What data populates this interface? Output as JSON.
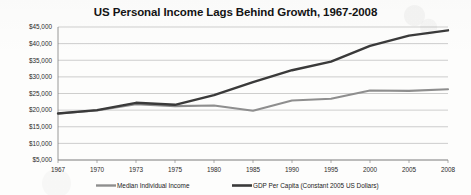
{
  "chart_data": {
    "type": "line",
    "title": "US Personal Income Lags Behind Growth, 1967-2008",
    "xlabel": "",
    "ylabel": "",
    "ylim": [
      5000,
      45000
    ],
    "ytick_values": [
      5000,
      10000,
      15000,
      20000,
      25000,
      30000,
      35000,
      40000,
      45000
    ],
    "ytick_labels": [
      "$5,000",
      "$10,000",
      "$15,000",
      "$20,000",
      "$25,000",
      "$30,000",
      "$35,000",
      "$40,000",
      "$45,000"
    ],
    "categories": [
      "1967",
      "1970",
      "1973",
      "1975",
      "1980",
      "1985",
      "1990",
      "1995",
      "2000",
      "2005",
      "2008"
    ],
    "xtick_labels": [
      "1967",
      "1970",
      "1973",
      "1975",
      "1980",
      "1985",
      "1990",
      "1995",
      "2000",
      "2005",
      "2008"
    ],
    "grid": true,
    "legend_position": "bottom",
    "series": [
      {
        "name": "Median Individual Income",
        "color": "#8e8e8e",
        "x": [
          "1967",
          "1970",
          "1973",
          "1975",
          "1980",
          "1985",
          "1990",
          "1995",
          "2000",
          "2005",
          "2008"
        ],
        "values": [
          19000,
          19900,
          21800,
          21200,
          21400,
          19800,
          22900,
          23400,
          25900,
          25800,
          26300
        ]
      },
      {
        "name": "GDP Per Capita (Constant 2005 US Dollars)",
        "color": "#3a3a3a",
        "x": [
          "1967",
          "1970",
          "1973",
          "1975",
          "1980",
          "1985",
          "1990",
          "1995",
          "2000",
          "2005",
          "2008"
        ],
        "values": [
          19000,
          20000,
          22200,
          21600,
          24500,
          28400,
          32000,
          34600,
          39300,
          42400,
          44000
        ]
      }
    ],
    "annotations": []
  },
  "legend": {
    "items": [
      {
        "label": "Median Individual Income"
      },
      {
        "label": "GDP Per Capita (Constant 2005 US Dollars)"
      }
    ]
  }
}
